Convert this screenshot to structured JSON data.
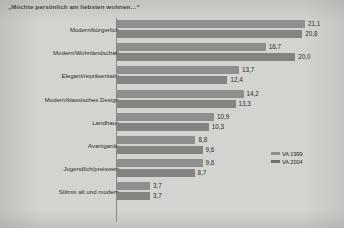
{
  "chart_data": {
    "type": "bar",
    "orientation": "horizontal",
    "title": "„Möchte persönlich am liebsten wohnen…“",
    "xlabel": "",
    "ylabel": "",
    "xlim": [
      0,
      21.1
    ],
    "grid": false,
    "legend_position": "lower-right",
    "value_decimal_separator": ",",
    "categories": [
      "Modern/bürgerlich",
      "Modern/Wohnlandschaft",
      "Elegant/repräsentativ",
      "Modern/klassisches Design",
      "Landhaus",
      "Avantgarde",
      "Jugendlich/preiswert",
      "Stilmix alt und modern"
    ],
    "series": [
      {
        "name": "VA 1999",
        "color": "#8e8e8c",
        "values": [
          21.1,
          16.7,
          13.7,
          14.2,
          10.9,
          8.8,
          9.6,
          3.7
        ],
        "labels": [
          "21,1",
          "16,7",
          "13,7",
          "14,2",
          "10,9",
          "8,8",
          "9,6",
          "3,7"
        ]
      },
      {
        "name": "VA 2004",
        "color": "#83837f",
        "values": [
          20.8,
          20.0,
          12.4,
          13.3,
          10.3,
          9.6,
          8.7,
          3.7
        ],
        "labels": [
          "20,8",
          "20,0",
          "12,4",
          "13,3",
          "10,3",
          "9,6",
          "8,7",
          "3,7"
        ]
      }
    ]
  },
  "legend": {
    "entries": [
      {
        "label": "VA 1999"
      },
      {
        "label": "VA 2004"
      }
    ]
  }
}
